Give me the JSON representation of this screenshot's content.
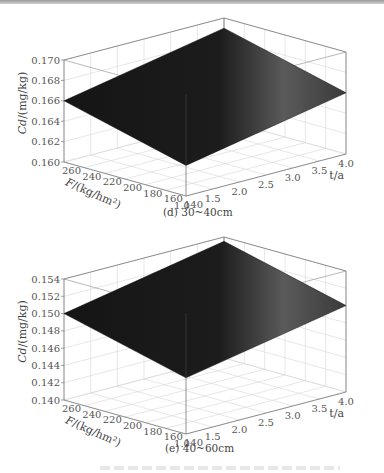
{
  "chart_data": [
    {
      "type": "surface3d",
      "panel": "d",
      "caption": "(d) 30~40cm",
      "zlabel": "Cd/(mg/kg)",
      "xlabel": "F/(kg/hm²)",
      "ylabel": "t/a",
      "x_ticks": [
        260,
        240,
        220,
        200,
        180,
        160,
        140
      ],
      "y_ticks": [
        1.0,
        1.5,
        2.0,
        2.5,
        3.0,
        3.5,
        4.0
      ],
      "z_ticks": [
        0.16,
        0.162,
        0.164,
        0.166,
        0.168,
        0.17
      ],
      "z_tick_labels": [
        "0.160",
        "0.162",
        "0.164",
        "0.166",
        "0.168",
        "0.170"
      ],
      "x_tick_labels": [
        "260",
        "240",
        "220",
        "200",
        "180",
        "160",
        "140"
      ],
      "y_tick_labels": [
        "1.0",
        "1.5",
        "2.0",
        "2.5",
        "3.0",
        "3.5",
        "4.0"
      ],
      "xlim": [
        140,
        260
      ],
      "ylim": [
        1.0,
        4.0
      ],
      "zlim": [
        0.16,
        0.17
      ],
      "grid": true,
      "surface_corners": {
        "F260_t1": 0.166,
        "F140_t1": 0.163,
        "F140_t4": 0.166,
        "F260_t4": 0.169
      },
      "surface_color": "#1a1a1a"
    },
    {
      "type": "surface3d",
      "panel": "e",
      "caption": "(e) 40~60cm",
      "zlabel": "Cd/(mg/kg)",
      "xlabel": "F/(kg/hm²)",
      "ylabel": "t/a",
      "x_ticks": [
        260,
        240,
        220,
        200,
        180,
        160,
        140
      ],
      "y_ticks": [
        1.0,
        1.5,
        2.0,
        2.5,
        3.0,
        3.5,
        4.0
      ],
      "z_ticks": [
        0.14,
        0.142,
        0.144,
        0.146,
        0.148,
        0.15,
        0.152,
        0.154
      ],
      "z_tick_labels": [
        "0.140",
        "0.142",
        "0.144",
        "0.146",
        "0.148",
        "0.150",
        "0.152",
        "0.154"
      ],
      "x_tick_labels": [
        "260",
        "240",
        "220",
        "200",
        "180",
        "160",
        "140"
      ],
      "y_tick_labels": [
        "1.0",
        "1.5",
        "2.0",
        "2.5",
        "3.0",
        "3.5",
        "4.0"
      ],
      "xlim": [
        140,
        260
      ],
      "ylim": [
        1.0,
        4.0
      ],
      "zlim": [
        0.14,
        0.154
      ],
      "grid": true,
      "surface_corners": {
        "F260_t1": 0.15,
        "F140_t1": 0.1465,
        "F140_t4": 0.15,
        "F260_t4": 0.1535
      },
      "surface_color": "#1a1a1a"
    }
  ],
  "panels": {
    "d": {
      "caption": "(d) 30~40cm",
      "zlabel": "Cd/(mg/kg)",
      "xlabel": "F/(kg/hm²)",
      "ylabel": "t/a"
    },
    "e": {
      "caption": "(e) 40~60cm",
      "zlabel": "Cd/(mg/kg)",
      "xlabel": "F/(kg/hm²)",
      "ylabel": "t/a"
    }
  }
}
